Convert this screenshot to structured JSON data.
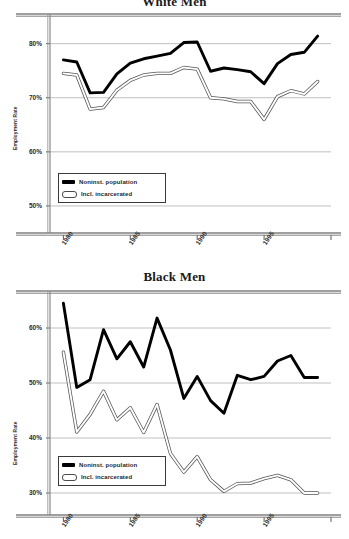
{
  "figure": {
    "series_labels": {
      "noninst": "Noninst. population",
      "incarcerated": "Incl. incarcerated"
    },
    "colors": {
      "noninst_line": "#000000",
      "incarcerated_line": "#ffffff",
      "incarcerated_edge": "#555555",
      "grid": "#b9b9b9",
      "axis": "#808080",
      "text": "#1f1f1f"
    }
  },
  "chart_data": [
    {
      "id": "white-men",
      "type": "line",
      "title": "White Men",
      "xlabel": "",
      "ylabel": "Employment Rate",
      "xlim": [
        1979,
        2000
      ],
      "ylim": [
        45,
        84
      ],
      "yticks": [
        "50%",
        "60%",
        "70%",
        "80%"
      ],
      "ytick_values": [
        50,
        60,
        70,
        80
      ],
      "xticks": [
        "1980",
        "1985",
        "1990",
        "1995"
      ],
      "xtick_values": [
        1980,
        1985,
        1990,
        1995
      ],
      "grid": true,
      "legend_position": "lower left",
      "x": [
        1980,
        1981,
        1982,
        1983,
        1984,
        1985,
        1986,
        1987,
        1988,
        1989,
        1990,
        1991,
        1992,
        1993,
        1994,
        1995,
        1996,
        1997,
        1998,
        1999
      ],
      "series": [
        {
          "name": "Noninst. population",
          "values": [
            77.0,
            76.6,
            70.9,
            71.0,
            74.4,
            76.4,
            77.2,
            77.7,
            78.2,
            80.2,
            80.3,
            74.9,
            75.5,
            75.2,
            74.8,
            72.6,
            76.3,
            78.0,
            78.4,
            81.4
          ]
        },
        {
          "name": "Incl. incarcerated",
          "values": [
            74.5,
            74.2,
            67.9,
            68.2,
            71.4,
            73.2,
            74.2,
            74.5,
            74.5,
            75.6,
            75.3,
            70.0,
            69.8,
            69.3,
            69.3,
            66.0,
            70.2,
            71.3,
            70.7,
            73.0
          ]
        }
      ]
    },
    {
      "id": "black-men",
      "type": "line",
      "title": "Black Men",
      "xlabel": "",
      "ylabel": "Employment Rate",
      "xlim": [
        1979,
        2000
      ],
      "ylim": [
        26,
        66
      ],
      "yticks": [
        "30%",
        "40%",
        "50%",
        "60%"
      ],
      "ytick_values": [
        30,
        40,
        50,
        60
      ],
      "xticks": [
        "1980",
        "1985",
        "1990",
        "1995"
      ],
      "xtick_values": [
        1980,
        1985,
        1990,
        1995
      ],
      "grid": true,
      "legend_position": "lower left",
      "x": [
        1980,
        1981,
        1982,
        1983,
        1984,
        1985,
        1986,
        1987,
        1988,
        1989,
        1990,
        1991,
        1992,
        1993,
        1994,
        1995,
        1996,
        1997,
        1998,
        1999
      ],
      "series": [
        {
          "name": "Noninst. population",
          "values": [
            64.5,
            49.2,
            50.6,
            59.7,
            54.4,
            57.5,
            52.9,
            61.8,
            56.0,
            47.2,
            51.2,
            46.8,
            44.5,
            51.4,
            50.6,
            51.2,
            54.0,
            55.0,
            51.0,
            51.0
          ]
        },
        {
          "name": "Incl. incarcerated",
          "values": [
            55.6,
            41.1,
            44.3,
            48.5,
            43.3,
            45.5,
            41.0,
            46.1,
            37.2,
            33.8,
            36.6,
            32.4,
            30.3,
            31.7,
            31.8,
            32.6,
            33.2,
            32.4,
            30.0,
            30.0
          ]
        }
      ]
    }
  ]
}
